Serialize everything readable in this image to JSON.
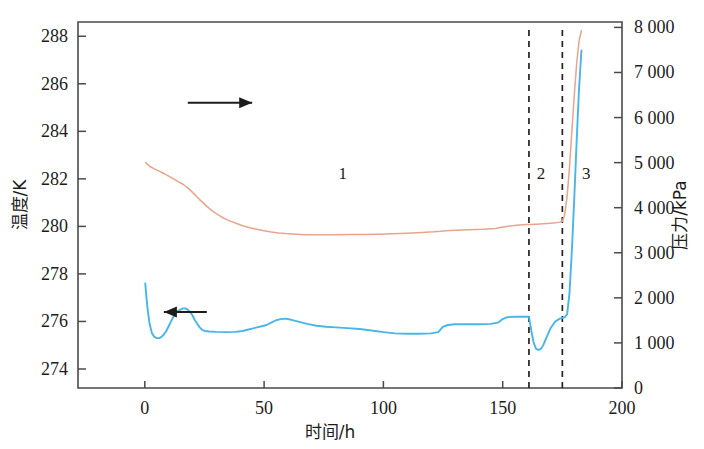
{
  "chart_data": {
    "type": "line",
    "title": "",
    "xlabel": "时间/h",
    "ylabel": "温度/K",
    "y2label": "压力/kPa",
    "xlim": [
      -28,
      200
    ],
    "ylim": [
      273.2,
      288.6
    ],
    "y2lim": [
      0,
      8120
    ],
    "grid": false,
    "legend": "none",
    "xticks": [
      0,
      50,
      100,
      150,
      200
    ],
    "xticklabels": [
      "0",
      "50",
      "100",
      "150",
      "200"
    ],
    "yticks": [
      274,
      276,
      278,
      280,
      282,
      284,
      286,
      288
    ],
    "yticklabels": [
      "274",
      "276",
      "278",
      "280",
      "282",
      "284",
      "286",
      "288"
    ],
    "y2ticks": [
      0,
      1000,
      2000,
      3000,
      4000,
      5000,
      6000,
      7000,
      8000
    ],
    "y2ticklabels": [
      "0",
      "1 000",
      "2 000",
      "3 000",
      "4 000",
      "5 000",
      "6 000",
      "7 000",
      "8 000"
    ],
    "annotations": [
      {
        "text": "1",
        "x": 83,
        "y_axis": "left",
        "y": 282.0,
        "name": "region-label-1"
      },
      {
        "text": "2",
        "x": 166,
        "y_axis": "left",
        "y": 282.0,
        "name": "region-label-2"
      },
      {
        "text": "3",
        "x": 185,
        "y_axis": "left",
        "y": 282.0,
        "name": "region-label-3"
      }
    ],
    "vlines": [
      {
        "x": 161,
        "style": "dashed",
        "name": "phase-divider-1-2"
      },
      {
        "x": 175,
        "style": "dashed",
        "name": "phase-divider-2-3"
      }
    ],
    "axis_pointers": [
      {
        "direction": "right",
        "target_axis": "y2",
        "label": "pressure-to-right-axis",
        "x_from": 18,
        "x_to": 45,
        "y": 285.2
      },
      {
        "direction": "left",
        "target_axis": "y1",
        "label": "temperature-to-left-axis",
        "x_from": 26,
        "x_to": 8,
        "y": 276.4
      }
    ],
    "series": [
      {
        "name": "压力/kPa",
        "axis": "y2",
        "color": "#e8a48c",
        "x": [
          0.4,
          2,
          4,
          6,
          8,
          10,
          12,
          14,
          16,
          18,
          20,
          23,
          26,
          29,
          32,
          35,
          38,
          41,
          44,
          47,
          50,
          53,
          56,
          59,
          62,
          65,
          68,
          72,
          76,
          80,
          86,
          92,
          98,
          104,
          110,
          116,
          121,
          124,
          126,
          130,
          136,
          142,
          147,
          149,
          151,
          154,
          157,
          160,
          161,
          164,
          167,
          170,
          172,
          174,
          175,
          176,
          177,
          178,
          179,
          180,
          181,
          182,
          183
        ],
        "y": [
          5000,
          4920,
          4860,
          4810,
          4760,
          4700,
          4640,
          4580,
          4520,
          4440,
          4340,
          4180,
          4030,
          3900,
          3800,
          3720,
          3660,
          3600,
          3555,
          3520,
          3490,
          3460,
          3440,
          3425,
          3415,
          3408,
          3402,
          3400,
          3400,
          3402,
          3405,
          3408,
          3412,
          3420,
          3432,
          3450,
          3465,
          3478,
          3490,
          3500,
          3510,
          3520,
          3540,
          3560,
          3580,
          3600,
          3615,
          3625,
          3628,
          3635,
          3645,
          3655,
          3665,
          3680,
          3700,
          3850,
          4250,
          4900,
          5700,
          6500,
          7200,
          7700,
          7930
        ]
      },
      {
        "name": "温度/K",
        "axis": "y1",
        "color": "#49b5e8",
        "x": [
          0.2,
          0.6,
          1.2,
          2,
          3,
          4,
          5,
          6,
          7,
          8,
          9,
          10,
          11,
          12,
          13,
          14,
          15,
          16,
          17,
          18,
          19,
          20,
          21,
          22,
          23,
          24,
          25,
          27,
          30,
          34,
          38,
          41,
          43,
          45,
          47,
          49,
          51,
          53,
          55,
          57,
          59,
          61,
          64,
          68,
          72,
          76,
          80,
          85,
          90,
          95,
          100,
          105,
          110,
          115,
          120,
          123,
          125,
          127,
          130,
          135,
          140,
          145,
          148,
          150,
          152,
          155,
          158,
          160,
          161,
          162,
          163,
          164,
          165,
          166,
          167,
          168,
          170,
          172,
          174,
          176,
          177,
          178,
          179,
          180,
          181,
          182,
          183
        ],
        "y": [
          277.6,
          277.1,
          276.5,
          275.9,
          275.5,
          275.35,
          275.3,
          275.3,
          275.35,
          275.45,
          275.6,
          275.8,
          276.0,
          276.2,
          276.35,
          276.45,
          276.5,
          276.55,
          276.55,
          276.5,
          276.4,
          276.25,
          276.05,
          275.9,
          275.75,
          275.65,
          275.6,
          275.58,
          275.56,
          275.55,
          275.56,
          275.6,
          275.65,
          275.7,
          275.75,
          275.8,
          275.85,
          275.95,
          276.05,
          276.1,
          276.12,
          276.08,
          276.0,
          275.9,
          275.82,
          275.78,
          275.75,
          275.72,
          275.68,
          275.62,
          275.55,
          275.5,
          275.48,
          275.48,
          275.5,
          275.55,
          275.78,
          275.85,
          275.88,
          275.88,
          275.88,
          275.9,
          275.95,
          276.1,
          276.18,
          276.2,
          276.2,
          276.2,
          276.2,
          275.6,
          275.1,
          274.85,
          274.8,
          274.85,
          275.0,
          275.25,
          275.7,
          276.0,
          276.12,
          276.18,
          276.3,
          277.2,
          279.0,
          281.2,
          283.6,
          285.8,
          287.4
        ]
      }
    ]
  }
}
